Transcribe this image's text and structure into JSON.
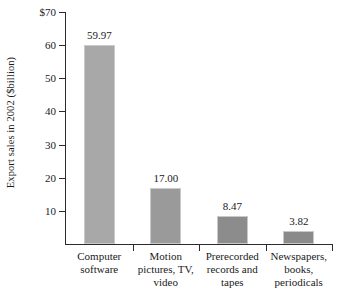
{
  "chart_data": {
    "type": "bar",
    "title": "",
    "xlabel": "",
    "ylabel": "Export sales in 2002 ($billion)",
    "ylim": [
      0,
      70
    ],
    "yticks": [
      "$70",
      "60",
      "50",
      "40",
      "30",
      "20",
      "10"
    ],
    "ytick_values": [
      70,
      60,
      50,
      40,
      30,
      20,
      10
    ],
    "grid": false,
    "legend": null,
    "categories": [
      "Computer software",
      "Motion pictures, TV, video",
      "Prerecorded records and tapes",
      "Newspapers, books, periodicals"
    ],
    "category_lines": [
      [
        "Computer",
        "software"
      ],
      [
        "Motion",
        "pictures, TV,",
        "video"
      ],
      [
        "Prerecorded",
        "records and",
        "tapes"
      ],
      [
        "Newspapers,",
        "books,",
        "periodicals"
      ]
    ],
    "values": [
      59.97,
      17.0,
      8.47,
      3.82
    ],
    "value_labels": [
      "59.97",
      "17.00",
      "8.47",
      "3.82"
    ],
    "bar_colors": [
      "#a8a8a8",
      "#9a9a9a",
      "#8c8c8c",
      "#8a8a8a"
    ],
    "axis_color": "#2b2b2b"
  }
}
